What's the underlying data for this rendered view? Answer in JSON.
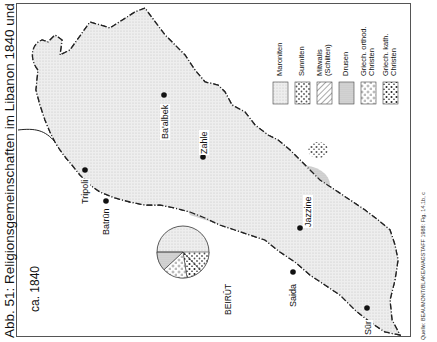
{
  "figure": {
    "title": "Abb. 51: Religionsgemeinschaften im Libanon 1840 und 1953",
    "source": "Quelle: BEAUMONT/BLAKE/WAGSTAFF 1988: Fig. 14.1b, c",
    "period_label": "ca. 1840"
  },
  "legend": {
    "items": [
      {
        "label": "Maroniten",
        "pattern": "fine-light-dots"
      },
      {
        "label": "Sunniten",
        "pattern": "coarse-dots"
      },
      {
        "label": "Mitwalis\n(Schiiten)",
        "pattern": "diagonal-hatch"
      },
      {
        "label": "Drusen",
        "pattern": "fine-stipple"
      },
      {
        "label": "Griech. orthod.\nChristen",
        "pattern": "open-circles"
      },
      {
        "label": "Griech. kath.\nChristen",
        "pattern": "filled-dots"
      }
    ]
  },
  "places": [
    {
      "name": "Ba'albek"
    },
    {
      "name": "Zahle"
    },
    {
      "name": "Tripoli"
    },
    {
      "name": "Batrūn"
    },
    {
      "name": "Jazzine"
    },
    {
      "name": "Saida"
    },
    {
      "name": "Sūr"
    },
    {
      "name": "BEIRŪT"
    }
  ],
  "beirut_pie": {
    "label": "BEIRŪT",
    "segments": [
      {
        "group": "Maroniten",
        "share": 0.5
      },
      {
        "group": "Drusen",
        "share": 0.2
      },
      {
        "group": "Griech. orthod. Christen",
        "share": 0.15
      },
      {
        "group": "Griech. kath. Christen",
        "share": 0.08
      },
      {
        "group": "Sunniten",
        "share": 0.07
      }
    ]
  }
}
